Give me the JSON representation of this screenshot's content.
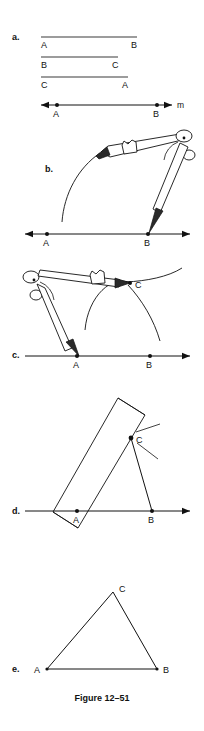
{
  "figure": {
    "caption": "Figure 12–51",
    "background_color": "#ffffff",
    "ink_color": "#111111",
    "width": 204,
    "height": 731
  },
  "steps": [
    {
      "key": "a",
      "label": "a.",
      "description": "Three given segments and a line m with points A and B marked.",
      "given_segments": [
        {
          "name": "segment-AB",
          "left_label": "A",
          "right_label": "B",
          "x1": 41,
          "x2": 137,
          "y": 37,
          "length_px": 96
        },
        {
          "name": "segment-BC",
          "left_label": "B",
          "right_label": "C",
          "x1": 41,
          "x2": 118,
          "y": 57,
          "length_px": 77
        },
        {
          "name": "segment-CA",
          "left_label": "C",
          "right_label": "A",
          "x1": 41,
          "x2": 128,
          "y": 77,
          "length_px": 87
        }
      ],
      "line": {
        "name": "line-m",
        "label": "m",
        "y": 105,
        "x_start": 41,
        "x_end": 172,
        "points": [
          {
            "label": "A",
            "x": 57
          },
          {
            "label": "B",
            "x": 157
          }
        ],
        "arrow_left": true,
        "arrow_right": true
      }
    },
    {
      "key": "b",
      "label": "b.",
      "description": "Compass set to length CA, needle at B, swinging an arc to the upper left.",
      "line": {
        "name": "line-m",
        "y": 234,
        "x_start": 25,
        "x_end": 190,
        "points": [
          {
            "label": "A",
            "x": 47
          },
          {
            "label": "B",
            "x": 148
          }
        ],
        "arrow_left": true,
        "arrow_right": true
      },
      "tool": "compass",
      "tool_orientation": "needle-right-pencil-left"
    },
    {
      "key": "c",
      "label": "c.",
      "description": "Compass needle at A, second arc drawn crossing the first arc at point C.",
      "line": {
        "name": "line-m",
        "y": 356,
        "x_start": 25,
        "x_end": 190,
        "points": [
          {
            "label": "A",
            "x": 77
          },
          {
            "label": "B",
            "x": 150
          }
        ],
        "arrow_left": false,
        "arrow_right": true
      },
      "intersection_label": "C",
      "tool": "compass",
      "tool_orientation": "needle-left-pencil-right"
    },
    {
      "key": "d",
      "label": "d.",
      "description": "Straightedge aligned through A and C to draw the sides of the triangle.",
      "line": {
        "name": "line-m",
        "y": 511,
        "x_start": 25,
        "x_end": 190,
        "points": [
          {
            "label": "A",
            "x": 77
          },
          {
            "label": "B",
            "x": 152
          }
        ],
        "arrow_left": false,
        "arrow_right": true
      },
      "vertex_label": "C",
      "tool": "straightedge"
    },
    {
      "key": "e",
      "label": "e.",
      "description": "Finished triangle ABC.",
      "triangle": {
        "vertices": [
          {
            "label": "A",
            "x": 47,
            "y": 669
          },
          {
            "label": "B",
            "x": 157,
            "y": 669
          },
          {
            "label": "C",
            "x": 113,
            "y": 592
          }
        ]
      }
    }
  ]
}
